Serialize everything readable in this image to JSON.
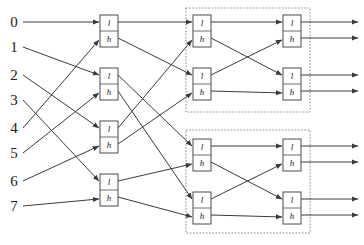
{
  "figure": {
    "width": 364,
    "height": 245,
    "background": "#ffffff",
    "wire_color": "#3a3a3a",
    "box_stroke": "#4a4a4a",
    "group_stroke": "#8a8a8a"
  },
  "inputs": {
    "labels": [
      "0",
      "1",
      "2",
      "3",
      "4",
      "5",
      "6",
      "7"
    ],
    "y": [
      22,
      47,
      75,
      100,
      128,
      153,
      181,
      206
    ],
    "x": 14
  },
  "filters": {
    "low_label": "l",
    "high_label": "h"
  },
  "stages": [
    {
      "name": "stage-1",
      "x": 100,
      "width": 18,
      "height": 32,
      "boxes": [
        {
          "id": "s1b0",
          "y": 15,
          "low_y": 22,
          "high_y": 38
        },
        {
          "id": "s1b1",
          "y": 68,
          "low_y": 75,
          "high_y": 91
        },
        {
          "id": "s1b2",
          "y": 121,
          "low_y": 128,
          "high_y": 144
        },
        {
          "id": "s1b3",
          "y": 174,
          "low_y": 181,
          "high_y": 197
        }
      ]
    },
    {
      "name": "stage-2",
      "x": 193,
      "width": 18,
      "height": 32,
      "boxes": [
        {
          "id": "s2b0",
          "y": 15,
          "low_y": 22,
          "high_y": 38
        },
        {
          "id": "s2b1",
          "y": 68,
          "low_y": 75,
          "high_y": 91
        },
        {
          "id": "s2b2",
          "y": 139,
          "low_y": 146,
          "high_y": 162
        },
        {
          "id": "s2b3",
          "y": 192,
          "low_y": 199,
          "high_y": 215
        }
      ]
    },
    {
      "name": "stage-3",
      "x": 283,
      "width": 18,
      "height": 32,
      "boxes": [
        {
          "id": "s3b0",
          "y": 15,
          "low_y": 22,
          "high_y": 38
        },
        {
          "id": "s3b1",
          "y": 68,
          "low_y": 75,
          "high_y": 91
        },
        {
          "id": "s3b2",
          "y": 139,
          "low_y": 146,
          "high_y": 162
        },
        {
          "id": "s3b3",
          "y": 192,
          "low_y": 199,
          "high_y": 215
        }
      ]
    }
  ],
  "group_boxes": [
    {
      "id": "group-upper",
      "x": 186,
      "y": 8,
      "width": 124,
      "height": 104
    },
    {
      "id": "group-lower",
      "x": 186,
      "y": 130,
      "width": 124,
      "height": 103
    }
  ],
  "outputs": {
    "x_end": 358,
    "y": [
      22,
      38,
      75,
      91,
      146,
      162,
      199,
      215
    ]
  },
  "stage1_connections": [
    {
      "from_input": 0,
      "to_box": 0,
      "port": "l"
    },
    {
      "from_input": 4,
      "to_box": 0,
      "port": "h"
    },
    {
      "from_input": 1,
      "to_box": 1,
      "port": "l"
    },
    {
      "from_input": 5,
      "to_box": 1,
      "port": "h"
    },
    {
      "from_input": 2,
      "to_box": 2,
      "port": "l"
    },
    {
      "from_input": 6,
      "to_box": 2,
      "port": "h"
    },
    {
      "from_input": 3,
      "to_box": 3,
      "port": "l"
    },
    {
      "from_input": 7,
      "to_box": 3,
      "port": "h"
    }
  ],
  "stage2_connections": [
    {
      "from": "s1b0.l",
      "to": "s2b0.l"
    },
    {
      "from": "s1b2.l",
      "to": "s2b0.h"
    },
    {
      "from": "s1b0.h",
      "to": "s2b1.l"
    },
    {
      "from": "s1b2.h",
      "to": "s2b1.h"
    },
    {
      "from": "s1b1.l",
      "to": "s2b2.l"
    },
    {
      "from": "s1b3.l",
      "to": "s2b2.h"
    },
    {
      "from": "s1b1.h",
      "to": "s2b3.l"
    },
    {
      "from": "s1b3.h",
      "to": "s2b3.h"
    }
  ],
  "stage3_connections": [
    {
      "from": "s2b0.l",
      "to": "s3b0.l"
    },
    {
      "from": "s2b1.l",
      "to": "s3b0.h"
    },
    {
      "from": "s2b0.h",
      "to": "s3b1.l"
    },
    {
      "from": "s2b1.h",
      "to": "s3b1.h"
    },
    {
      "from": "s2b2.l",
      "to": "s3b2.l"
    },
    {
      "from": "s2b3.l",
      "to": "s3b2.h"
    },
    {
      "from": "s2b2.h",
      "to": "s3b3.l"
    },
    {
      "from": "s2b3.h",
      "to": "s3b3.h"
    }
  ]
}
